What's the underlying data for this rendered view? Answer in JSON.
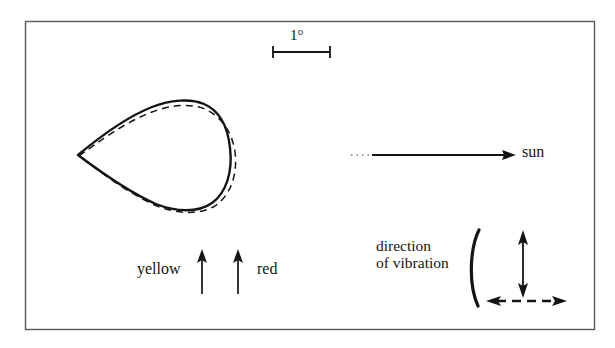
{
  "figure": {
    "frame": {
      "stroke_color": "#555555"
    },
    "ink_color": "#141414",
    "scale_bar": {
      "label": "1°",
      "x_start": 272,
      "x_end": 331,
      "y": 52,
      "tick_half_height": 6
    },
    "coma": {
      "description": "teardrop-shaped comet coma isophote, apex pointing sunward (left)",
      "solid_curve_name": "coma-outline-solid",
      "dashed_curve_name": "coma-outline-dashed",
      "apex": [
        78,
        155
      ],
      "extent_x": [
        78,
        232
      ],
      "extent_y": [
        101,
        210
      ]
    },
    "sun_arrow": {
      "label": "sun",
      "dotted_start_x": 351,
      "solid_start_x": 374,
      "tip_x": 515,
      "y": 155
    },
    "polarization": {
      "yellow_label": "yellow",
      "red_label": "red",
      "yellow_arrow": {
        "x": 202,
        "y_bottom": 294,
        "y_top": 250
      },
      "red_arrow": {
        "x": 238,
        "y_bottom": 294,
        "y_top": 250
      }
    },
    "vibration": {
      "line1": "direction",
      "line2": "of vibration",
      "brace": {
        "x": 472,
        "y_top": 230,
        "y_bottom": 306
      },
      "vertical_arrow": {
        "x": 523,
        "y_top": 231,
        "y_bottom": 297
      },
      "horizontal_dashed_arrow": {
        "y": 301,
        "x_left": 486,
        "x_right": 566
      }
    }
  }
}
